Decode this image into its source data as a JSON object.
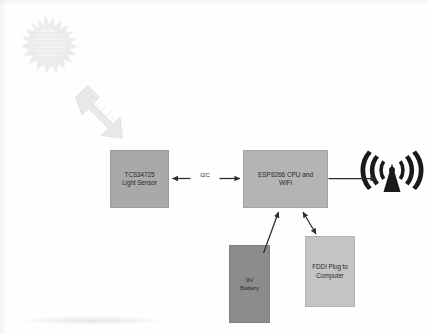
{
  "diagram": {
    "background_color": "#fefefe",
    "blocks": [
      {
        "id": "light-sensor",
        "label": "TCS34725\nLight Sensor",
        "line1": "TCS34725",
        "line2": "Light Sensor",
        "fill": "#a9a9a9"
      },
      {
        "id": "esp-cpu",
        "label": "ESP8266 CPU and WiFi",
        "line1": "ESP8266 CPU and",
        "line2": "WiFi",
        "fill": "#b4b4b4"
      },
      {
        "id": "battery",
        "label": "9V Battery",
        "line1": "9V",
        "line2": "Battery",
        "fill": "#8c8c8c"
      },
      {
        "id": "ftdi-plug",
        "label": "FDDI Plug to Computer",
        "line1": "FDDI Plug to",
        "line2": "Computer",
        "fill": "#c4c4c4"
      }
    ],
    "connectors": [
      {
        "id": "sensor-to-cpu",
        "label": "I2C",
        "from": "light-sensor",
        "to": "esp-cpu",
        "arrowheads": "both"
      },
      {
        "id": "cpu-to-antenna",
        "label": "",
        "from": "esp-cpu",
        "to": "wifi-antenna",
        "arrowheads": "end"
      },
      {
        "id": "battery-to-cpu",
        "label": "",
        "from": "battery",
        "to": "esp-cpu",
        "arrowheads": "end"
      },
      {
        "id": "ftdi-to-cpu",
        "label": "",
        "from": "ftdi-plug",
        "to": "esp-cpu",
        "arrowheads": "both"
      }
    ],
    "decorations": [
      {
        "id": "sun-burst",
        "name": "sun-starburst",
        "fill": "#ededed"
      },
      {
        "id": "light-ray-arrow",
        "name": "block-arrow-down-right",
        "fill": "#e8e8e8"
      },
      {
        "id": "wifi-antenna",
        "name": "wifi-transmission-icon",
        "fill": "#1a1a1a"
      }
    ],
    "line_color": "#2b2b2b"
  }
}
